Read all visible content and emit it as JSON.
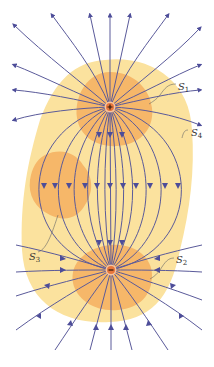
{
  "diagram": {
    "type": "electric-field-lines-dipole",
    "charges": [
      {
        "sign": "+",
        "x": 110,
        "y": 107,
        "label": "positive-charge"
      },
      {
        "sign": "−",
        "x": 111,
        "y": 270,
        "label": "negative-charge"
      }
    ],
    "surfaces": [
      {
        "id": "S1",
        "main": "S",
        "sub": "1",
        "label_x": 178,
        "label_y": 87
      },
      {
        "id": "S2",
        "main": "S",
        "sub": "2",
        "label_x": 176,
        "label_y": 262
      },
      {
        "id": "S3",
        "main": "S",
        "sub": "3",
        "label_x": 31,
        "label_y": 255
      },
      {
        "id": "S4",
        "main": "S",
        "sub": "4",
        "label_x": 190,
        "label_y": 133
      }
    ],
    "colors": {
      "field_line": "#5a5a9a",
      "arrow": "#4d4d99",
      "outer_region": "#fbe29e",
      "inner_region": "#f6b769",
      "charge_fill": "#e8773c",
      "charge_ring": "#f7c6a0",
      "background": "#ffffff"
    }
  }
}
